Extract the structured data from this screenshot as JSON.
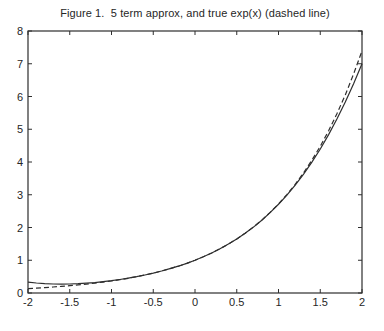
{
  "figure": {
    "background": "#ffffff"
  },
  "chart_data": {
    "type": "line",
    "title": "Figure 1.  5 term approx, and true exp(x) (dashed line)",
    "xlabel": "",
    "ylabel": "",
    "xlim": [
      -2,
      2
    ],
    "ylim": [
      0,
      8
    ],
    "x_ticks": [
      -2,
      -1.5,
      -1,
      -0.5,
      0,
      0.5,
      1,
      1.5,
      2
    ],
    "x_tick_labels": [
      "-2",
      "-1.5",
      "-1",
      "-0.5",
      "0",
      "0.5",
      "1",
      "1.5",
      "2"
    ],
    "y_ticks": [
      0,
      1,
      2,
      3,
      4,
      5,
      6,
      7,
      8
    ],
    "y_tick_labels": [
      "0",
      "1",
      "2",
      "3",
      "4",
      "5",
      "6",
      "7",
      "8"
    ],
    "grid": false,
    "legend_position": "none",
    "axes_color": "#2e2e2e",
    "line_color": "#2e2e2e",
    "x": [
      -2.0,
      -1.9,
      -1.8,
      -1.7,
      -1.6,
      -1.5,
      -1.4,
      -1.3,
      -1.2,
      -1.1,
      -1.0,
      -0.9,
      -0.8,
      -0.7,
      -0.6,
      -0.5,
      -0.4,
      -0.3,
      -0.2,
      -0.1,
      0.0,
      0.1,
      0.2,
      0.3,
      0.4,
      0.5,
      0.6,
      0.7,
      0.8,
      0.9,
      1.0,
      1.1,
      1.2,
      1.3,
      1.4,
      1.5,
      1.6,
      1.7,
      1.8,
      1.9,
      2.0
    ],
    "series": [
      {
        "name": "5 term approx",
        "style": "solid",
        "values": [
          0.3333,
          0.3048,
          0.2854,
          0.2742,
          0.2704,
          0.2734,
          0.2827,
          0.2978,
          0.3184,
          0.3442,
          0.375,
          0.4108,
          0.4517,
          0.4978,
          0.5494,
          0.6068,
          0.6704,
          0.7408,
          0.8187,
          0.9048,
          1.0,
          1.1052,
          1.2214,
          1.3498,
          1.4917,
          1.6484,
          1.8214,
          2.0122,
          2.2224,
          2.4538,
          2.7083,
          2.9878,
          3.2944,
          3.6302,
          3.9974,
          4.3984,
          4.8357,
          5.3118,
          5.8294,
          6.3912,
          7.0
        ]
      },
      {
        "name": "true exp(x) (dashed line)",
        "style": "dashed",
        "values": [
          0.1353,
          0.1496,
          0.1653,
          0.1827,
          0.2019,
          0.2231,
          0.2466,
          0.2725,
          0.3012,
          0.3329,
          0.3679,
          0.4066,
          0.4493,
          0.4966,
          0.5488,
          0.6065,
          0.6703,
          0.7408,
          0.8187,
          0.9048,
          1.0,
          1.1052,
          1.2214,
          1.3499,
          1.4918,
          1.6487,
          1.8221,
          2.0138,
          2.2255,
          2.4596,
          2.7183,
          3.0042,
          3.3201,
          3.6693,
          4.0552,
          4.4817,
          4.953,
          5.4739,
          6.0496,
          6.6859,
          7.3891
        ]
      }
    ]
  }
}
